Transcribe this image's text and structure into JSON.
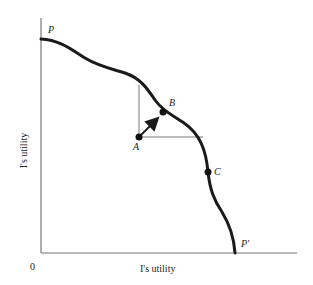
{
  "diagram": {
    "type": "utility-possibility-frontier",
    "x_axis_label": "I's utility",
    "y_axis_label": "I's utility",
    "origin_label": "0",
    "curve_start_label": "P",
    "curve_end_label": "P′",
    "points": [
      {
        "label": "A",
        "role": "interior starting point"
      },
      {
        "label": "B",
        "role": "point on frontier reached by arrow from A"
      },
      {
        "label": "C",
        "role": "point on frontier"
      }
    ],
    "colors": {
      "curve": "#1a1a1a",
      "axes": "#777777",
      "guides": "#777777"
    }
  }
}
